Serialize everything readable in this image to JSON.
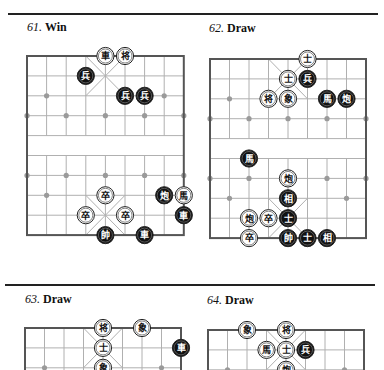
{
  "page": {
    "rules": [
      {
        "x": 8,
        "y": 13,
        "width": 370
      },
      {
        "x": 5,
        "y": 284,
        "width": 370
      }
    ]
  },
  "colors": {
    "board_border": "#555555",
    "grid_line": "#b0b0b0",
    "marker": "#9a9a9a",
    "red_piece_fill": "#ffffff",
    "red_piece_text": "#111111",
    "black_piece_fill": "#111111",
    "black_piece_text": "#ffffff"
  },
  "puzzles": [
    {
      "number": "61.",
      "result": "Win",
      "title_pos": {
        "x": 27,
        "y": 20
      },
      "board": {
        "left": 27,
        "top": 56,
        "dx": 19.6,
        "dy": 19.9
      },
      "pieces": [
        {
          "char": "車",
          "side": "red",
          "col": 4,
          "row": 0
        },
        {
          "char": "将",
          "side": "red",
          "col": 5,
          "row": 0
        },
        {
          "char": "兵",
          "side": "black",
          "col": 3,
          "row": 1
        },
        {
          "char": "兵",
          "side": "black",
          "col": 5,
          "row": 2
        },
        {
          "char": "兵",
          "side": "black",
          "col": 6,
          "row": 2
        },
        {
          "char": "卒",
          "side": "red",
          "col": 4,
          "row": 7
        },
        {
          "char": "炮",
          "side": "black",
          "col": 7,
          "row": 7
        },
        {
          "char": "馬",
          "side": "red",
          "col": 8,
          "row": 7
        },
        {
          "char": "卒",
          "side": "red",
          "col": 3,
          "row": 8
        },
        {
          "char": "卒",
          "side": "red",
          "col": 5,
          "row": 8
        },
        {
          "char": "車",
          "side": "black",
          "col": 8,
          "row": 8
        },
        {
          "char": "帥",
          "side": "black",
          "col": 4,
          "row": 9
        },
        {
          "char": "車",
          "side": "black",
          "col": 6,
          "row": 9
        }
      ],
      "rows_visible": 10
    },
    {
      "number": "62.",
      "result": "Draw",
      "title_pos": {
        "x": 209,
        "y": 21
      },
      "board": {
        "left": 210,
        "top": 59,
        "dx": 19.5,
        "dy": 19.9
      },
      "pieces": [
        {
          "char": "士",
          "side": "red",
          "col": 5,
          "row": 0
        },
        {
          "char": "士",
          "side": "red",
          "col": 4,
          "row": 1
        },
        {
          "char": "兵",
          "side": "black",
          "col": 5,
          "row": 1
        },
        {
          "char": "将",
          "side": "red",
          "col": 3,
          "row": 2
        },
        {
          "char": "象",
          "side": "red",
          "col": 4,
          "row": 2
        },
        {
          "char": "馬",
          "side": "black",
          "col": 6,
          "row": 2
        },
        {
          "char": "炮",
          "side": "black",
          "col": 7,
          "row": 2
        },
        {
          "char": "馬",
          "side": "black",
          "col": 2,
          "row": 5
        },
        {
          "char": "炮",
          "side": "red",
          "col": 4,
          "row": 6
        },
        {
          "char": "相",
          "side": "black",
          "col": 4,
          "row": 7
        },
        {
          "char": "炮",
          "side": "red",
          "col": 2,
          "row": 8
        },
        {
          "char": "卒",
          "side": "red",
          "col": 3,
          "row": 8
        },
        {
          "char": "士",
          "side": "black",
          "col": 4,
          "row": 8
        },
        {
          "char": "卒",
          "side": "red",
          "col": 2,
          "row": 9
        },
        {
          "char": "帥",
          "side": "black",
          "col": 4,
          "row": 9
        },
        {
          "char": "士",
          "side": "black",
          "col": 5,
          "row": 9
        },
        {
          "char": "相",
          "side": "black",
          "col": 6,
          "row": 9
        }
      ],
      "rows_visible": 10
    },
    {
      "number": "63.",
      "result": "Draw",
      "title_pos": {
        "x": 25,
        "y": 292
      },
      "board": {
        "left": 25,
        "top": 328,
        "dx": 19.5,
        "dy": 19.9
      },
      "pieces": [
        {
          "char": "将",
          "side": "red",
          "col": 4,
          "row": 0
        },
        {
          "char": "象",
          "side": "red",
          "col": 6,
          "row": 0
        },
        {
          "char": "士",
          "side": "red",
          "col": 4,
          "row": 1
        },
        {
          "char": "車",
          "side": "black",
          "col": 8,
          "row": 1
        },
        {
          "char": "象",
          "side": "red",
          "col": 4,
          "row": 2
        }
      ],
      "rows_visible": 3
    },
    {
      "number": "64.",
      "result": "Draw",
      "title_pos": {
        "x": 207,
        "y": 293
      },
      "board": {
        "left": 208,
        "top": 330,
        "dx": 19.5,
        "dy": 19.9
      },
      "pieces": [
        {
          "char": "象",
          "side": "red",
          "col": 2,
          "row": 0
        },
        {
          "char": "将",
          "side": "red",
          "col": 4,
          "row": 0
        },
        {
          "char": "馬",
          "side": "red",
          "col": 3,
          "row": 1
        },
        {
          "char": "士",
          "side": "red",
          "col": 4,
          "row": 1
        },
        {
          "char": "兵",
          "side": "black",
          "col": 5,
          "row": 1
        },
        {
          "char": "炮",
          "side": "red",
          "col": 4,
          "row": 2
        }
      ],
      "rows_visible": 3
    }
  ]
}
